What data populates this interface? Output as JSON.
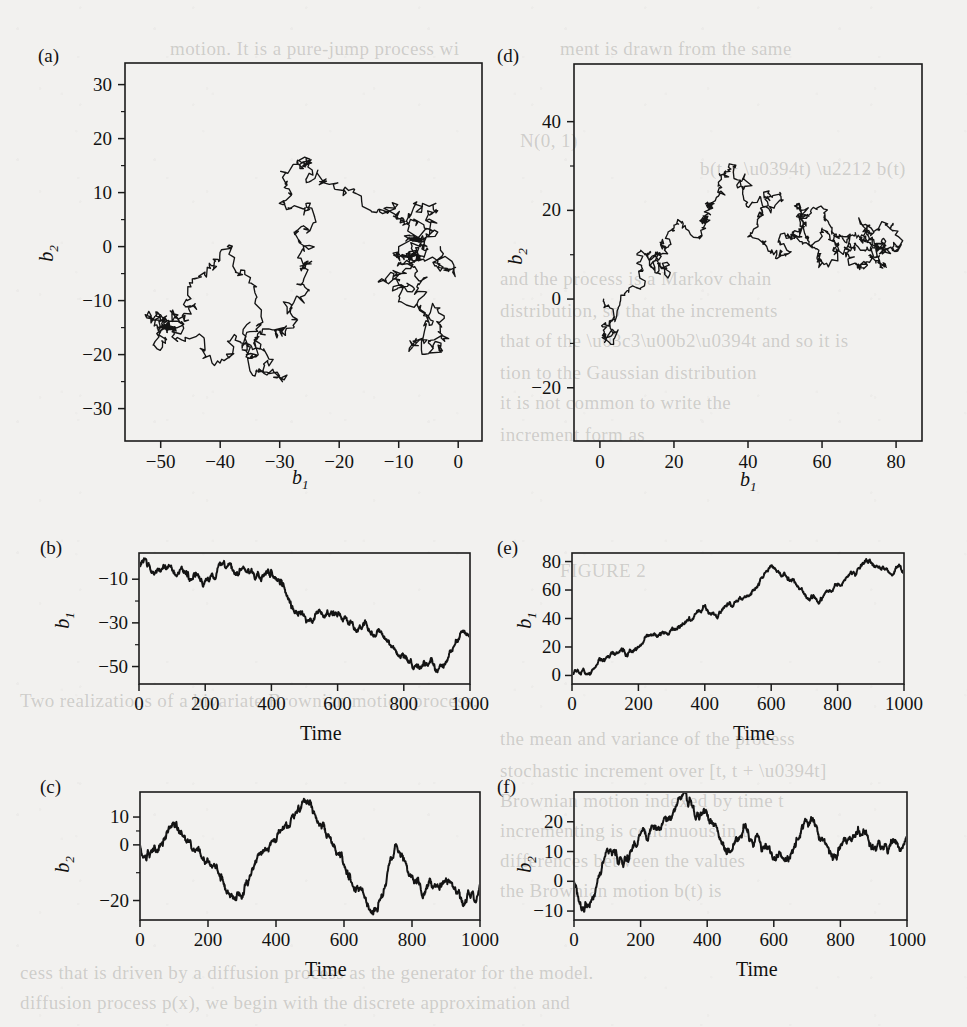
{
  "figure": {
    "background_color": "#f2f1ef",
    "ink_color": "#141414",
    "panels": [
      {
        "tag": "(a)",
        "type": "scatter",
        "plot_kind": "phase-plane random walk",
        "xlabel": "b1",
        "ylabel": "b2",
        "xticks": [
          -50,
          -40,
          -30,
          -20,
          -10,
          0
        ],
        "xticklabels": [
          "−50",
          "−40",
          "−30",
          "−20",
          "−10",
          "0"
        ],
        "yticks": [
          30,
          20,
          10,
          0,
          -10,
          -20,
          -30
        ],
        "yticklabels": [
          "30",
          "20",
          "10",
          "0",
          "−10",
          "−20",
          "−30"
        ],
        "xlim": [
          -56,
          4
        ],
        "ylim": [
          -36,
          34
        ],
        "series_name": "walk-a"
      },
      {
        "tag": "(d)",
        "type": "scatter",
        "plot_kind": "phase-plane random walk",
        "xlabel": "b1",
        "ylabel": "b2",
        "xticks": [
          0,
          20,
          40,
          60,
          80
        ],
        "xticklabels": [
          "0",
          "20",
          "40",
          "60",
          "80"
        ],
        "yticks": [
          40,
          20,
          0,
          -20
        ],
        "yticklabels": [
          "40",
          "20",
          "0",
          "−20"
        ],
        "xlim": [
          -7,
          87
        ],
        "ylim": [
          -32,
          53
        ],
        "series_name": "walk-d"
      },
      {
        "tag": "(b)",
        "type": "line",
        "plot_kind": "time series",
        "xlabel": "Time",
        "ylabel": "b1",
        "xticks": [
          0,
          200,
          400,
          600,
          800,
          1000
        ],
        "xticklabels": [
          "0",
          "200",
          "400",
          "600",
          "800",
          "1000"
        ],
        "yticks": [
          -10,
          -30,
          -50
        ],
        "yticklabels": [
          "−10",
          "−30",
          "−50"
        ],
        "xlim": [
          0,
          1000
        ],
        "ylim": [
          -58,
          2
        ],
        "series_name": "b1-drift-down"
      },
      {
        "tag": "(e)",
        "type": "line",
        "plot_kind": "time series",
        "xlabel": "Time",
        "ylabel": "b1",
        "xticks": [
          0,
          200,
          400,
          600,
          800,
          1000
        ],
        "xticklabels": [
          "0",
          "200",
          "400",
          "600",
          "800",
          "1000"
        ],
        "yticks": [
          80,
          60,
          40,
          20,
          0
        ],
        "yticklabels": [
          "80",
          "60",
          "40",
          "20",
          "0"
        ],
        "xlim": [
          0,
          1000
        ],
        "ylim": [
          -6,
          86
        ],
        "series_name": "b1-drift-up"
      },
      {
        "tag": "(c)",
        "type": "line",
        "plot_kind": "time series",
        "xlabel": "Time",
        "ylabel": "b2",
        "xticks": [
          0,
          200,
          400,
          600,
          800,
          1000
        ],
        "xticklabels": [
          "0",
          "200",
          "400",
          "600",
          "800",
          "1000"
        ],
        "yticks": [
          10,
          0,
          -20
        ],
        "yticklabels": [
          "10",
          "0",
          "−20"
        ],
        "xlim": [
          0,
          1000
        ],
        "ylim": [
          -27,
          19
        ],
        "series_name": "b2-mean-reverting"
      },
      {
        "tag": "(f)",
        "type": "line",
        "plot_kind": "time series",
        "xlabel": "Time",
        "ylabel": "b2",
        "xticks": [
          0,
          200,
          400,
          600,
          800,
          1000
        ],
        "xticklabels": [
          "0",
          "200",
          "400",
          "600",
          "800",
          "1000"
        ],
        "yticks": [
          20,
          10,
          0,
          -10
        ],
        "yticklabels": [
          "20",
          "10",
          "0",
          "−10"
        ],
        "xlim": [
          0,
          1000
        ],
        "ylim": [
          -13,
          30
        ],
        "series_name": "b2-hump"
      }
    ]
  },
  "chart_data": {
    "type": "line",
    "title": "",
    "n_steps": 1000,
    "panels": [
      {
        "tag": "(a)",
        "type": "scatter",
        "xlabel": "b1",
        "ylabel": "b2",
        "xlim": [
          -56,
          4
        ],
        "ylim": [
          -36,
          34
        ],
        "grid": false,
        "legend": "none",
        "note": "trajectory of (b1,b2) for realization 1; starts near (0,0), drifts toward (-50,-18)"
      },
      {
        "tag": "(b)",
        "type": "line",
        "xlabel": "Time",
        "ylabel": "b1",
        "xlim": [
          0,
          1000
        ],
        "ylim": [
          -58,
          2
        ],
        "grid": false,
        "legend": "none",
        "x": [
          0,
          50,
          100,
          150,
          200,
          250,
          300,
          350,
          400,
          450,
          500,
          550,
          600,
          650,
          700,
          750,
          800,
          850,
          900,
          950,
          1000
        ],
        "y": [
          -3,
          -7,
          -6,
          -10,
          -11,
          -3,
          -8,
          -10,
          -6,
          -19,
          -27,
          -25,
          -26,
          -33,
          -35,
          -38,
          -45,
          -50,
          -52,
          -41,
          -35
        ]
      },
      {
        "tag": "(c)",
        "type": "line",
        "xlabel": "Time",
        "ylabel": "b2",
        "xlim": [
          0,
          1000
        ],
        "ylim": [
          -27,
          19
        ],
        "grid": false,
        "legend": "none",
        "x": [
          0,
          50,
          100,
          150,
          200,
          250,
          300,
          350,
          400,
          450,
          500,
          550,
          600,
          650,
          700,
          750,
          800,
          850,
          900,
          950,
          1000
        ],
        "y": [
          0,
          -2,
          8,
          0,
          -6,
          -16,
          -19,
          -3,
          2,
          11,
          16,
          3,
          -7,
          -16,
          -23,
          0,
          -11,
          -13,
          -12,
          -22,
          -14
        ]
      },
      {
        "tag": "(d)",
        "type": "scatter",
        "xlabel": "b1",
        "ylabel": "b2",
        "xlim": [
          -7,
          87
        ],
        "ylim": [
          -32,
          53
        ],
        "grid": false,
        "legend": "none",
        "note": "trajectory of (b1,b2) for realization 2; starts near (0,-5), drifts to (80,12) arching over (40,25)"
      },
      {
        "tag": "(e)",
        "type": "line",
        "xlabel": "Time",
        "ylabel": "b1",
        "xlim": [
          0,
          1000
        ],
        "ylim": [
          -6,
          86
        ],
        "grid": false,
        "legend": "none",
        "x": [
          0,
          50,
          100,
          150,
          200,
          250,
          300,
          350,
          400,
          450,
          500,
          550,
          600,
          650,
          700,
          750,
          800,
          850,
          900,
          950,
          1000
        ],
        "y": [
          1,
          1,
          11,
          19,
          20,
          29,
          32,
          39,
          49,
          45,
          52,
          60,
          77,
          67,
          57,
          53,
          64,
          72,
          79,
          74,
          74
        ]
      },
      {
        "tag": "(f)",
        "type": "line",
        "xlabel": "Time",
        "ylabel": "b2",
        "xlim": [
          0,
          1000
        ],
        "ylim": [
          -13,
          30
        ],
        "grid": false,
        "legend": "none",
        "x": [
          0,
          50,
          100,
          150,
          200,
          250,
          300,
          350,
          400,
          450,
          500,
          550,
          600,
          650,
          700,
          750,
          800,
          850,
          900,
          950,
          1000
        ],
        "y": [
          0,
          -7,
          11,
          6,
          16,
          18,
          24,
          27,
          22,
          12,
          15,
          16,
          8,
          9,
          20,
          14,
          12,
          16,
          11,
          12,
          15
        ]
      }
    ]
  }
}
